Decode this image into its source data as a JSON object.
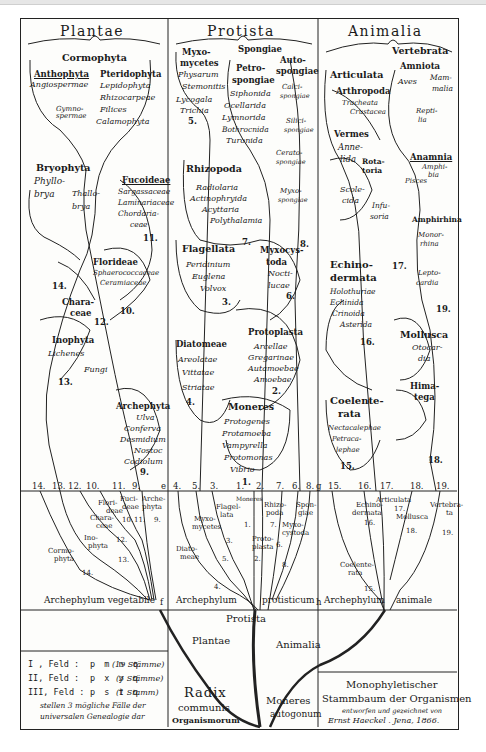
{
  "kingdoms": {
    "plantae": "Plantae",
    "protista": "Protista",
    "animalia": "Animalia"
  },
  "plantae": {
    "cormophyta": "Cormophyta",
    "anthophyta": {
      "label": "Anthophyta",
      "items": [
        "Angiospermae",
        "Gymno-",
        "spermae"
      ]
    },
    "pteridophyta": {
      "label": "Pteridophyta",
      "items": [
        "Lepidophyta",
        "Rhizocarpeae",
        "Filices",
        "Calamophyta"
      ]
    },
    "bryophyta": {
      "label": "Bryophyta",
      "items": [
        "Phyllo-",
        "brya",
        "Thallo-",
        "brya"
      ]
    },
    "fucoideae": {
      "label": "Fucoideae",
      "items": [
        "Sargassaceae",
        "Laminariaceae",
        "Chordaria-",
        "ceae"
      ],
      "num": "11."
    },
    "florideae": {
      "label": "Florideae",
      "items": [
        "Sphaerococcaceae",
        "Ceramiaceae"
      ],
      "num": "10."
    },
    "characeae": {
      "label": [
        "Chara-",
        "ceae"
      ],
      "num": "12."
    },
    "inophyta": {
      "label": "Inophyta",
      "items": [
        "Lichenes",
        "Fungi"
      ],
      "num": "13."
    },
    "archephyta": {
      "label": "Archephyta",
      "items": [
        "Ulva",
        "Conferva",
        "Desmidium",
        "Nostoc",
        "Codiolum"
      ],
      "num": "9."
    },
    "trunk_num": "14."
  },
  "protista": {
    "myxomycetes": {
      "label": [
        "Myxo-",
        "mycetes"
      ],
      "items": [
        "Physarum",
        "Stemonitis",
        "Lycogala",
        "Trichia"
      ],
      "num": "5."
    },
    "spongiae": "Spongiae",
    "petrospongiae": {
      "label": [
        "Petro-",
        "spongiae"
      ],
      "items": [
        "Siphonida",
        "Ocellarida",
        "Lymnorida",
        "Bothrocnida",
        "Turonida"
      ]
    },
    "autospongiae": {
      "label": [
        "Auto-",
        "spongiae"
      ],
      "items": [
        "Calci-",
        "spongiae",
        "Silici-",
        "spongiae",
        "Cerato-",
        "spongiae",
        "Myxo-",
        "spongiae"
      ],
      "num": "8."
    },
    "rhizopoda": {
      "label": "Rhizopoda",
      "items": [
        "Radiolaria",
        "Actinophryida",
        "Acyttaria",
        "Polythalamia"
      ],
      "num": "7."
    },
    "flagellata": {
      "label": "Flagellata",
      "items": [
        "Peridinium",
        "Euglena",
        "Volvox"
      ],
      "num": "3."
    },
    "myxocystoda": {
      "label": [
        "Myxocys-",
        "toda"
      ],
      "items": [
        "Nocti-",
        "lucae"
      ],
      "num": "6."
    },
    "diatomeae": {
      "label": "Diatomeae",
      "items": [
        "Areolatae",
        "Vittatae",
        "Striatae"
      ],
      "num": "4."
    },
    "protoplasta": {
      "label": "Protoplasta",
      "items": [
        "Arcellae",
        "Gregarinae",
        "Autamoebae",
        "Amoebae"
      ],
      "num": "2."
    },
    "moneres": {
      "label": "Moneres",
      "items": [
        "Protogenes",
        "Protamoeba",
        "Vampyrella",
        "Protomonas",
        "Vibrio"
      ],
      "num": "1."
    }
  },
  "animalia": {
    "vertebrata": "Vertebrata",
    "amniota": {
      "label": "Amniota",
      "items": [
        "Aves",
        "Mam-",
        "malia",
        "Repti-",
        "lia"
      ]
    },
    "articulata": "Articulata",
    "arthropoda": {
      "label": "Arthropoda",
      "items": [
        "Tracheata",
        "Crustacea"
      ]
    },
    "vermes": {
      "label": "Vermes",
      "items": [
        "Anne-",
        "lida",
        "Rota-",
        "toria",
        "Scole-",
        "cida",
        "Infu-",
        "soria"
      ]
    },
    "anamnia": {
      "label": "Anamnia",
      "items": [
        "Amphi-",
        "bia",
        "Pisces"
      ]
    },
    "amphirhina": "Amphirhina",
    "monorhina": [
      "Monor-",
      "rhina"
    ],
    "leptocardia": [
      "Lepto-",
      "cardia"
    ],
    "echinodermata": {
      "label": [
        "Echino-",
        "dermata"
      ],
      "items": [
        "Holothuriae",
        "Echinida",
        "Crinoida",
        "Asterida"
      ],
      "num": "16."
    },
    "mollusca": {
      "label": "Mollusca",
      "items": [
        "Otocar-",
        "dia"
      ]
    },
    "himatega": [
      "Hima-",
      "tega"
    ],
    "coelenterata": {
      "label": [
        "Coelente-",
        "rata"
      ],
      "items": [
        "Nectacalephae",
        "Petraca-",
        "lephae"
      ],
      "num": "15."
    },
    "nums": {
      "n17": "17.",
      "n18": "18.",
      "n19": "19."
    }
  },
  "grid": {
    "plant_numbers": [
      "14.",
      "13.",
      "12.",
      "10.",
      "11.",
      "9."
    ],
    "protist_numbers": [
      "4.",
      "5.",
      "3.",
      "1.",
      "2.",
      "7.",
      "6.",
      "8."
    ],
    "animal_numbers": [
      "15.",
      "16.",
      "17.",
      "18.",
      "19."
    ],
    "letters": {
      "e": "e",
      "f": "f",
      "g": "g",
      "h": "h"
    },
    "plant_labels": {
      "flori": [
        "Flori-",
        "deae"
      ],
      "fuci": [
        "Fuci-",
        "deae"
      ],
      "arche": [
        "Arche-",
        "phyta"
      ],
      "chara": [
        "Chara-",
        "ceae"
      ],
      "ino": [
        "Ino-",
        "phyta"
      ],
      "cormo": [
        "Cormo-",
        "phyta"
      ],
      "n10": "10.",
      "n11": "11.",
      "n9": "9.",
      "n12": "12.",
      "n13": "13.",
      "n14": "14."
    },
    "protist_labels": {
      "moneres": "Moneres",
      "flagellata": [
        "Flagel-",
        "lata"
      ],
      "myxomycetes": [
        "Myxo-",
        "mycetes"
      ],
      "rhizopoda": [
        "Rhizo-",
        "poda"
      ],
      "spongiae": [
        "Spon-",
        "giae"
      ],
      "myxocystoda": [
        "Myxo-",
        "cystoda"
      ],
      "protoplasta": [
        "Proto-",
        "plasta"
      ],
      "diatomeae": [
        "Diato-",
        "meae"
      ],
      "n1": "1.",
      "n3": "3.",
      "n7": "7.",
      "n6": "6.",
      "n2": "2.",
      "n5": "5.",
      "n8": "8.",
      "n4": "4."
    },
    "animal_labels": {
      "articulata": "Articulata",
      "echinodermata": [
        "Echino-",
        "dermata"
      ],
      "mollusca": "Mollusca",
      "vertebrata": [
        "Vertebra-",
        "ta"
      ],
      "coelenterata": [
        "Coelente-",
        "rata"
      ],
      "n17": "17.",
      "n16": "16.",
      "n18": "18.",
      "n19": "19.",
      "n15": "15."
    }
  },
  "roots": {
    "archephylum_vegetabile": "Archephylum vegetabile",
    "archephylum_protisticum": [
      "Archephylum",
      "protisticum"
    ],
    "archephylum_animale": [
      "Archephylum",
      "animale"
    ],
    "protista": "Protista",
    "plantae": "Plantae",
    "animalia": "Animalia",
    "radix": [
      "Radix",
      "communis",
      "Organismorum"
    ],
    "moneres": [
      "Moneres",
      "autogonum"
    ]
  },
  "legend": {
    "rows": [
      {
        "field": "I , Feld :",
        "letters": "p m n q",
        "note": "(19 Stämme)"
      },
      {
        "field": "II, Feld :",
        "letters": "p x y q",
        "note": "(3 Stämme)"
      },
      {
        "field": "III, Feld :",
        "letters": "p s t q",
        "note": "(1 Stamm)"
      }
    ],
    "caption": [
      "stellen 3 mögliche Fälle der",
      "universalen Genealogie dar"
    ]
  },
  "title_box": {
    "line1": "Monophyletischer",
    "line2": "Stammbaum der Organismen",
    "line3": "entworfen und gezeichnet von",
    "line4": "Ernst Haeckel . Jena, 1866."
  }
}
